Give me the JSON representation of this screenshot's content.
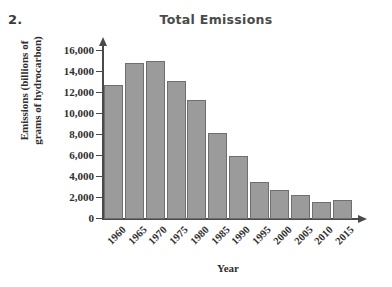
{
  "problem_number": "2.",
  "chart_data": {
    "type": "bar",
    "title": "Total Emissions",
    "xlabel": "Year",
    "ylabel_line1": "Emissions (billions of",
    "ylabel_line2": "grams of hydrocarbon)",
    "ylabel": "Emissions (billions of grams of hydrocarbon)",
    "categories": [
      "1960",
      "1965",
      "1970",
      "1975",
      "1980",
      "1985",
      "1990",
      "1995",
      "2000",
      "2005",
      "2010",
      "2015"
    ],
    "values": [
      12750,
      14800,
      15000,
      13150,
      11300,
      8150,
      5950,
      3450,
      2700,
      2200,
      1600,
      1750
    ],
    "ylim": [
      0,
      17000
    ],
    "ytick_values": [
      0,
      2000,
      4000,
      6000,
      8000,
      10000,
      12000,
      14000,
      16000
    ],
    "ytick_labels": [
      "0",
      "2,000",
      "4,000",
      "6,000",
      "8,000",
      "10,000",
      "12,000",
      "14,000",
      "16,000"
    ],
    "grid": false,
    "legend": "none",
    "bar_color": "#9b9b9b",
    "bar_edge_color": "#6f6f6f",
    "axis_color": "#4a4a4a",
    "background_color": "#ffffff"
  }
}
